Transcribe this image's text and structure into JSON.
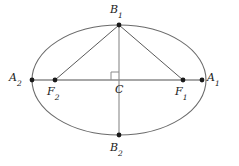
{
  "figure": {
    "type": "geometry-diagram",
    "canvas": {
      "width": 239,
      "height": 166
    },
    "colors": {
      "background": "#ffffff",
      "stroke": "#6b6b6b",
      "axis_stroke": "#8a8a8a",
      "chord_stroke": "#5a5a5a",
      "point_fill": "#1a1a1a",
      "label_color": "#1a1a1a"
    },
    "ellipse": {
      "center_x": 119,
      "center_y": 80,
      "semi_major_a": 87,
      "semi_minor_b": 55,
      "stroke_width": 1.1
    },
    "points": [
      {
        "id": "B1",
        "label": "B",
        "subscript": "1",
        "x": 119,
        "y": 25,
        "role": "minor-axis-vertex-top"
      },
      {
        "id": "B2",
        "label": "B",
        "subscript": "2",
        "x": 119,
        "y": 135,
        "role": "minor-axis-vertex-bottom"
      },
      {
        "id": "A2",
        "label": "A",
        "subscript": "2",
        "x": 32,
        "y": 80,
        "role": "major-axis-vertex-left"
      },
      {
        "id": "A1",
        "label": "A",
        "subscript": "1",
        "x": 202,
        "y": 80,
        "role": "major-axis-vertex-right"
      },
      {
        "id": "F2",
        "label": "F",
        "subscript": "2",
        "x": 55,
        "y": 80,
        "role": "focus-left"
      },
      {
        "id": "F1",
        "label": "F",
        "subscript": "1",
        "x": 183,
        "y": 80,
        "role": "focus-right"
      },
      {
        "id": "C",
        "label": "C",
        "subscript": "",
        "x": 119,
        "y": 80,
        "role": "center"
      }
    ],
    "segments": [
      {
        "id": "major-axis",
        "from": "A2",
        "to": "A1",
        "x1": 32,
        "y1": 80,
        "x2": 202,
        "y2": 80
      },
      {
        "id": "minor-axis",
        "from": "B1",
        "to": "B2",
        "x1": 119,
        "y1": 25,
        "x2": 119,
        "y2": 135
      },
      {
        "id": "chord-B1-F2",
        "from": "B1",
        "to": "F2",
        "x1": 119,
        "y1": 25,
        "x2": 55,
        "y2": 80
      },
      {
        "id": "chord-B1-F1",
        "from": "B1",
        "to": "F1",
        "x1": 119,
        "y1": 25,
        "x2": 183,
        "y2": 80
      }
    ],
    "right_angle_marker": {
      "at": "C",
      "size": 8,
      "corner_x": 119,
      "corner_y": 80,
      "opens": "up-left"
    },
    "point_radius": 2.4
  }
}
